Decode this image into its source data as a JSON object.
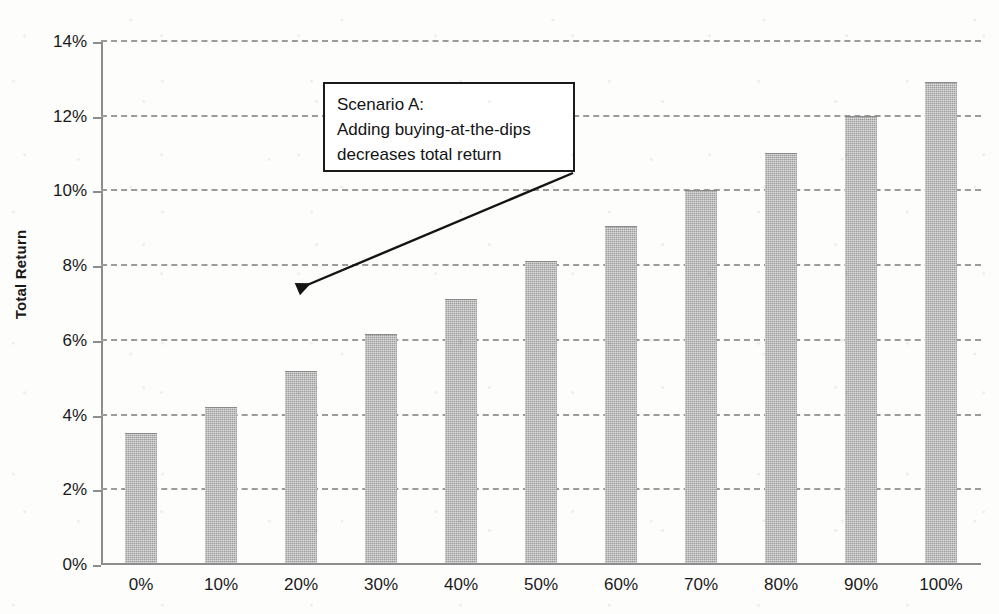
{
  "chart_data": {
    "type": "bar",
    "title": "",
    "xlabel": "",
    "ylabel": "Total Return",
    "categories": [
      "0%",
      "10%",
      "20%",
      "30%",
      "40%",
      "50%",
      "60%",
      "70%",
      "80%",
      "90%",
      "100%"
    ],
    "values": [
      3.45,
      4.15,
      5.1,
      6.1,
      7.05,
      8.05,
      9.0,
      9.95,
      10.95,
      11.95,
      12.85
    ],
    "value_unit": "%",
    "ylim": [
      0,
      14
    ],
    "ytick_step": 2,
    "ytick_labels": [
      "0%",
      "2%",
      "4%",
      "6%",
      "8%",
      "10%",
      "12%",
      "14%"
    ],
    "ytick_values": [
      0,
      2,
      4,
      6,
      8,
      10,
      12,
      14
    ],
    "grid": true,
    "grid_style": "dashed",
    "grid_axis": "y",
    "legend": false,
    "legend_position": "none",
    "series": [
      {
        "name": "Total Return",
        "values": [
          3.45,
          4.15,
          5.1,
          6.1,
          7.05,
          8.05,
          9.0,
          9.95,
          10.95,
          11.95,
          12.85
        ]
      }
    ],
    "annotations": [
      {
        "id": "scenario-a",
        "lines": [
          "Scenario A:",
          "Adding buying-at-the-dips",
          "decreases total return"
        ],
        "points_to_category": "20%"
      }
    ],
    "colors": {
      "bar_fill": "#9d9d9d",
      "grid": "#9b9b9b",
      "axis": "#8d8d8d",
      "text": "#1a1a1a",
      "annotation_border": "#1a1a1a",
      "annotation_fill": "#ffffff",
      "background": "#fdfdfc"
    }
  }
}
